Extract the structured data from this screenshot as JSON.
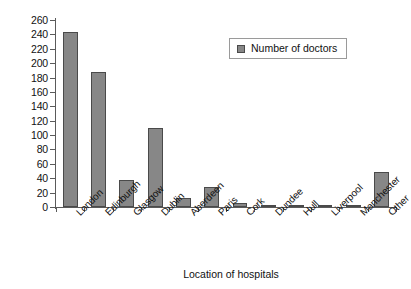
{
  "chart_data": {
    "type": "bar",
    "title": "",
    "xlabel": "Location of hospitals",
    "ylabel": "",
    "categories": [
      "London",
      "Edinburgh",
      "Glasgow",
      "Dublin",
      "Aberdeen",
      "Paris",
      "Cork",
      "Dundee",
      "Hull",
      "Liverpool",
      "Manchester",
      "Other"
    ],
    "series": [
      {
        "name": "Number of doctors",
        "values": [
          244,
          188,
          37,
          110,
          13,
          28,
          5,
          3,
          3,
          3,
          3,
          48
        ]
      }
    ],
    "ylim": [
      0,
      260
    ],
    "ytick_step": 20,
    "yticks": [
      0,
      20,
      40,
      60,
      80,
      100,
      120,
      140,
      160,
      180,
      200,
      220,
      240,
      260
    ],
    "grid": false,
    "legend_position": "top-right",
    "bar_color": "#878787",
    "bar_border_color": "#4a4a4a",
    "axis_color": "#5a5a5a",
    "text_color": "#111111",
    "background": "#ffffff"
  },
  "legend": {
    "entries": [
      {
        "label": "Number of doctors",
        "color": "#878787"
      }
    ]
  }
}
